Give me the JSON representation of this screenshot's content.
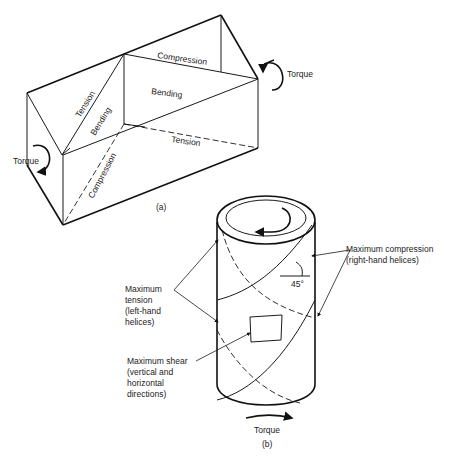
{
  "figure_a": {
    "caption": "(a)",
    "labels": {
      "torque_left": "Torque",
      "torque_right": "Torque",
      "compression_top": "Compression",
      "bending_top": "Bending",
      "tension_diag": "Tension",
      "bending_diag": "Bending",
      "compression_diag": "Compression",
      "tension_bottom": "Tension"
    }
  },
  "figure_b": {
    "caption": "(b)",
    "labels": {
      "max_compression_line1": "Maximum compression",
      "max_compression_line2": "(right-hand helices)",
      "max_tension_line1": "Maximum",
      "max_tension_line2": "tension",
      "max_tension_line3": "(left-hand",
      "max_tension_line4": "helices)",
      "max_shear_line1": "Maximum shear",
      "max_shear_line2": "(vertical and",
      "max_shear_line3": "horizontal",
      "max_shear_line4": "directions)",
      "angle": "45°",
      "torque": "Torque"
    }
  }
}
